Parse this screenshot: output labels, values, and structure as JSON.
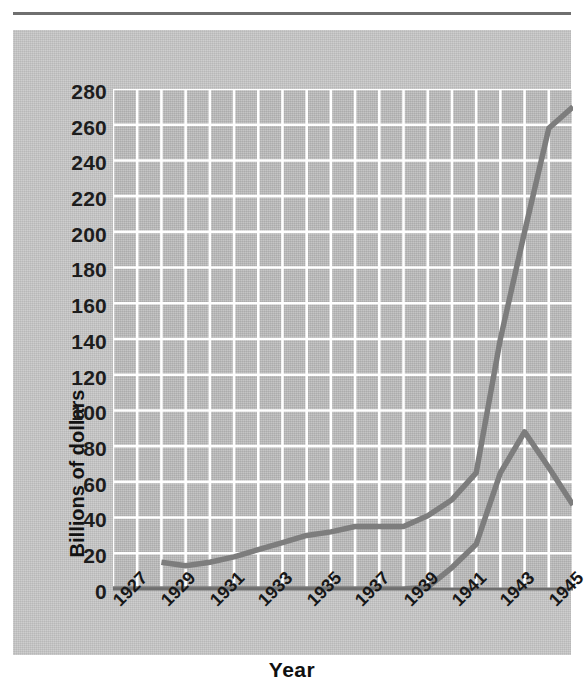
{
  "figure": {
    "background_color": "#c8c8c8",
    "plot_background_color": "#bdbdbd",
    "gridline_color": "#ffffff",
    "line_color": "#7d7d7d",
    "axis_color": "#6f6f6f"
  },
  "axis": {
    "x_title": "Year",
    "y_title": "Billions of dollars"
  },
  "chart_data": {
    "type": "line",
    "title": "",
    "xlabel": "Year",
    "ylabel": "Billions of dollars",
    "xlim": [
      1927,
      1946
    ],
    "ylim": [
      0,
      280
    ],
    "y_ticks": [
      0,
      20,
      40,
      60,
      80,
      100,
      120,
      140,
      160,
      180,
      200,
      220,
      240,
      260,
      280
    ],
    "y_tick_labels": [
      "0",
      "20",
      "40",
      "60",
      "80",
      "100",
      "120",
      "140",
      "160",
      "180",
      "200",
      "220",
      "240",
      "260",
      "280"
    ],
    "x_ticks": [
      1927,
      1929,
      1931,
      1933,
      1935,
      1937,
      1939,
      1941,
      1943,
      1945
    ],
    "x_tick_labels": [
      "1927",
      "1929",
      "1931",
      "1933",
      "1935",
      "1937",
      "1939",
      "1941",
      "1943",
      "1945"
    ],
    "x_minor_gridline_step": 1,
    "grid": true,
    "grid_axes": "both",
    "legend": false,
    "legend_position": "none",
    "x_tick_label_rotation": -45,
    "series": [
      {
        "name": "Upper line",
        "x": [
          1929,
          1930,
          1931,
          1932,
          1933,
          1934,
          1935,
          1936,
          1937,
          1938,
          1939,
          1940,
          1941,
          1942,
          1943,
          1944,
          1945,
          1946
        ],
        "values": [
          15,
          13,
          15,
          18,
          22,
          26,
          30,
          32,
          35,
          35,
          35,
          41,
          50,
          65,
          140,
          200,
          258,
          270
        ]
      },
      {
        "name": "Lower line",
        "x": [
          1927,
          1928,
          1929,
          1930,
          1931,
          1932,
          1933,
          1934,
          1935,
          1936,
          1937,
          1938,
          1939,
          1940,
          1941,
          1942,
          1943,
          1944,
          1945,
          1946
        ],
        "values": [
          0,
          0,
          0,
          0,
          0,
          0,
          0,
          0,
          0,
          0,
          0,
          0,
          0,
          1,
          12,
          25,
          65,
          88,
          68,
          47
        ]
      }
    ]
  }
}
